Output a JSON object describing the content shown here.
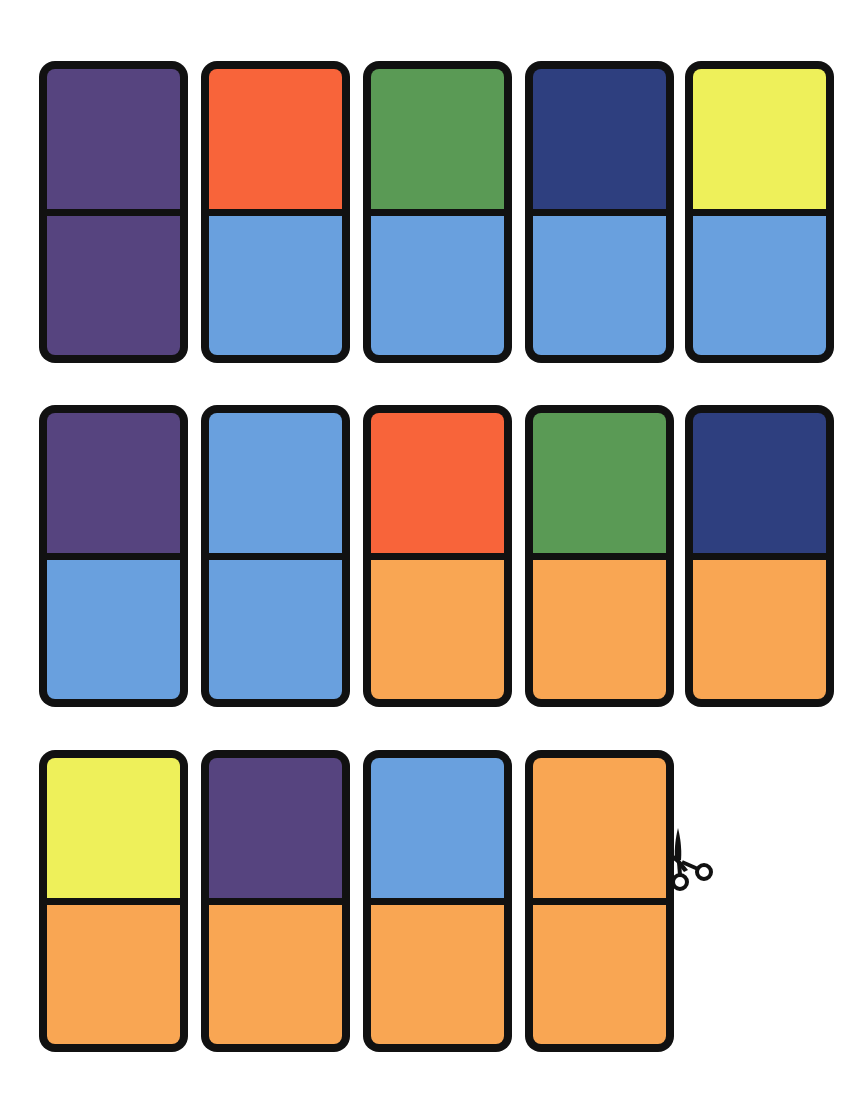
{
  "colors": {
    "purple": "#56447f",
    "orange_red": "#f8643a",
    "green": "#5a9a55",
    "navy": "#2e3f7f",
    "yellow": "#eef05a",
    "light_blue": "#69a0de",
    "orange": "#f9a653",
    "border": "#111111"
  },
  "dominoes": [
    {
      "row": 1,
      "col": 1,
      "top": "purple",
      "bottom": "purple"
    },
    {
      "row": 1,
      "col": 2,
      "top": "orange_red",
      "bottom": "light_blue"
    },
    {
      "row": 1,
      "col": 3,
      "top": "green",
      "bottom": "light_blue"
    },
    {
      "row": 1,
      "col": 4,
      "top": "navy",
      "bottom": "light_blue"
    },
    {
      "row": 1,
      "col": 5,
      "top": "yellow",
      "bottom": "light_blue"
    },
    {
      "row": 2,
      "col": 1,
      "top": "purple",
      "bottom": "light_blue"
    },
    {
      "row": 2,
      "col": 2,
      "top": "light_blue",
      "bottom": "light_blue"
    },
    {
      "row": 2,
      "col": 3,
      "top": "orange_red",
      "bottom": "orange"
    },
    {
      "row": 2,
      "col": 4,
      "top": "green",
      "bottom": "orange"
    },
    {
      "row": 2,
      "col": 5,
      "top": "navy",
      "bottom": "orange"
    },
    {
      "row": 3,
      "col": 1,
      "top": "yellow",
      "bottom": "orange"
    },
    {
      "row": 3,
      "col": 2,
      "top": "purple",
      "bottom": "orange"
    },
    {
      "row": 3,
      "col": 3,
      "top": "light_blue",
      "bottom": "orange"
    },
    {
      "row": 3,
      "col": 4,
      "top": "orange",
      "bottom": "orange"
    }
  ],
  "icons": {
    "cut_line": "scissors-icon"
  }
}
